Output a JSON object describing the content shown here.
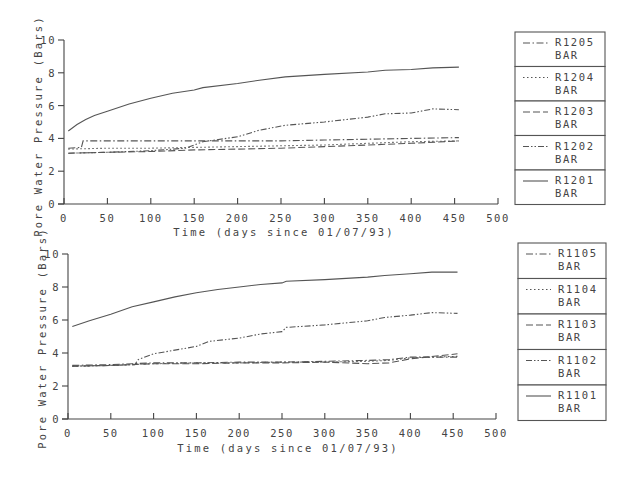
{
  "chart_data": [
    {
      "type": "line",
      "title": "",
      "xlabel": "Time (days since 01/07/93)",
      "ylabel": "Pore Water Pressure (Bars)",
      "xlim": [
        0,
        500
      ],
      "ylim": [
        0,
        10
      ],
      "xticks": [
        0,
        50,
        100,
        150,
        200,
        250,
        300,
        350,
        400,
        450,
        500
      ],
      "yticks": [
        0,
        2,
        4,
        6,
        8,
        10
      ],
      "grid": false,
      "legend_position": "right",
      "series": [
        {
          "name": "R1205",
          "unit": "BAR",
          "style": "dash-dot",
          "x": [
            5,
            20,
            22,
            50,
            100,
            150,
            200,
            250,
            300,
            350,
            400,
            455
          ],
          "y": [
            3.4,
            3.45,
            3.85,
            3.85,
            3.85,
            3.85,
            3.85,
            3.85,
            3.9,
            3.95,
            4.0,
            4.05
          ]
        },
        {
          "name": "R1204",
          "unit": "BAR",
          "style": "dotted",
          "x": [
            5,
            50,
            100,
            150,
            200,
            250,
            300,
            350,
            400,
            455
          ],
          "y": [
            3.35,
            3.4,
            3.4,
            3.45,
            3.5,
            3.55,
            3.6,
            3.7,
            3.8,
            3.85
          ]
        },
        {
          "name": "R1203",
          "unit": "BAR",
          "style": "dashed",
          "x": [
            5,
            50,
            100,
            150,
            200,
            250,
            300,
            350,
            400,
            455
          ],
          "y": [
            3.1,
            3.15,
            3.2,
            3.3,
            3.35,
            3.4,
            3.5,
            3.6,
            3.7,
            3.85
          ]
        },
        {
          "name": "R1202",
          "unit": "BAR",
          "style": "dash-dot-dot",
          "x": [
            5,
            50,
            100,
            140,
            160,
            200,
            225,
            255,
            300,
            350,
            370,
            400,
            425,
            455
          ],
          "y": [
            3.1,
            3.15,
            3.25,
            3.4,
            3.8,
            4.1,
            4.5,
            4.8,
            5.0,
            5.3,
            5.5,
            5.55,
            5.8,
            5.75
          ]
        },
        {
          "name": "R1201",
          "unit": "BAR",
          "style": "solid",
          "x": [
            5,
            15,
            25,
            35,
            50,
            75,
            100,
            125,
            150,
            160,
            200,
            225,
            255,
            300,
            350,
            370,
            400,
            425,
            455
          ],
          "y": [
            4.45,
            4.85,
            5.15,
            5.4,
            5.65,
            6.1,
            6.45,
            6.75,
            6.95,
            7.1,
            7.35,
            7.55,
            7.75,
            7.9,
            8.05,
            8.15,
            8.2,
            8.3,
            8.35
          ]
        }
      ]
    },
    {
      "type": "line",
      "title": "",
      "xlabel": "Time (days since 01/07/93)",
      "ylabel": "Pore Water Pressure (Bars)",
      "xlim": [
        0,
        500
      ],
      "ylim": [
        0,
        10
      ],
      "xticks": [
        0,
        50,
        100,
        150,
        200,
        250,
        300,
        350,
        400,
        450,
        500
      ],
      "yticks": [
        0,
        2,
        4,
        6,
        8,
        10
      ],
      "grid": false,
      "legend_position": "right",
      "series": [
        {
          "name": "R1105",
          "unit": "BAR",
          "style": "dash-dot",
          "x": [
            5,
            50,
            75,
            100,
            150,
            200,
            250,
            300,
            350,
            375,
            400,
            455
          ],
          "y": [
            3.25,
            3.3,
            3.35,
            3.4,
            3.4,
            3.45,
            3.45,
            3.5,
            3.55,
            3.6,
            3.75,
            3.75
          ]
        },
        {
          "name": "R1104",
          "unit": "BAR",
          "style": "dotted",
          "x": [
            5,
            50,
            75,
            100,
            150,
            200,
            250,
            300,
            350,
            375,
            400,
            455
          ],
          "y": [
            3.2,
            3.25,
            3.3,
            3.35,
            3.4,
            3.4,
            3.45,
            3.45,
            3.5,
            3.55,
            3.7,
            3.8
          ]
        },
        {
          "name": "R1103",
          "unit": "BAR",
          "style": "dashed",
          "x": [
            5,
            50,
            75,
            100,
            150,
            200,
            250,
            300,
            350,
            375,
            400,
            455
          ],
          "y": [
            3.2,
            3.25,
            3.3,
            3.35,
            3.35,
            3.4,
            3.4,
            3.45,
            3.35,
            3.4,
            3.65,
            3.95
          ]
        },
        {
          "name": "R1102",
          "unit": "BAR",
          "style": "dash-dot-dot",
          "x": [
            5,
            50,
            78,
            82,
            100,
            150,
            165,
            200,
            225,
            250,
            255,
            300,
            350,
            370,
            400,
            425,
            455
          ],
          "y": [
            3.2,
            3.25,
            3.3,
            3.6,
            3.95,
            4.4,
            4.7,
            4.9,
            5.15,
            5.3,
            5.55,
            5.7,
            5.95,
            6.15,
            6.3,
            6.45,
            6.4
          ]
        },
        {
          "name": "R1101",
          "unit": "BAR",
          "style": "solid",
          "x": [
            5,
            25,
            50,
            75,
            100,
            125,
            150,
            175,
            200,
            225,
            250,
            255,
            300,
            350,
            370,
            400,
            425,
            455
          ],
          "y": [
            5.6,
            5.95,
            6.35,
            6.8,
            7.1,
            7.4,
            7.65,
            7.85,
            8.0,
            8.15,
            8.25,
            8.35,
            8.45,
            8.6,
            8.7,
            8.8,
            8.9,
            8.9
          ]
        }
      ]
    }
  ]
}
